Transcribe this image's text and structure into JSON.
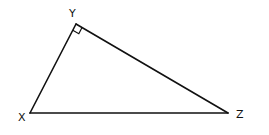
{
  "diagram": {
    "type": "right-triangle",
    "vertices": [
      {
        "id": "X",
        "label": "X",
        "x": 30,
        "y": 113,
        "label_x": 18,
        "label_y": 121
      },
      {
        "id": "Y",
        "label": "Y",
        "x": 76,
        "y": 24,
        "label_x": 69,
        "label_y": 17
      },
      {
        "id": "Z",
        "label": "Z",
        "x": 228,
        "y": 113,
        "label_x": 236,
        "label_y": 118
      }
    ],
    "edges": [
      [
        "X",
        "Y"
      ],
      [
        "Y",
        "Z"
      ],
      [
        "X",
        "Z"
      ]
    ],
    "right_angle_at": "Y",
    "stroke_color": "#111111"
  }
}
